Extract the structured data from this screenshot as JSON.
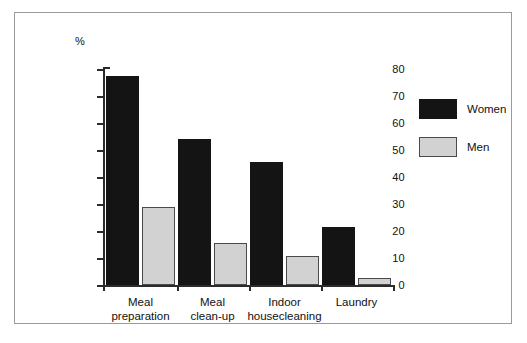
{
  "figure": {
    "unit_label": "%",
    "border_color": "#9a9a9a"
  },
  "legend": {
    "position": "right",
    "entries": [
      {
        "label": "Women",
        "color": "#141414"
      },
      {
        "label": "Men",
        "color": "#d2d2d2"
      }
    ]
  },
  "axis": {
    "y_ticks": [
      "0",
      "10",
      "20",
      "30",
      "40",
      "50",
      "60",
      "70",
      "80"
    ]
  },
  "chart_data": {
    "type": "bar",
    "title": "",
    "subtitle": "",
    "xlabel": "",
    "ylabel": "%",
    "ylim": [
      0,
      80
    ],
    "ytick_step": 10,
    "grid": false,
    "legend_position": "right",
    "categories": [
      "Meal\npreparation",
      "Meal\nclean-up",
      "Indoor\nhousecleaning",
      "Laundry"
    ],
    "series": [
      {
        "name": "Women",
        "color": "#141414",
        "values": [
          77.5,
          54,
          45.5,
          21.5
        ]
      },
      {
        "name": "Men",
        "color": "#d2d2d2",
        "values": [
          29,
          15.5,
          10.8,
          2.5
        ]
      }
    ]
  }
}
